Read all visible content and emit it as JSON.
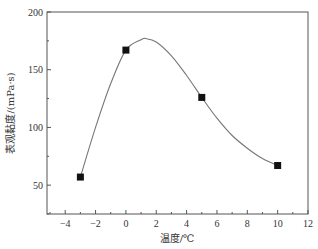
{
  "chart_data": {
    "type": "line",
    "title": "",
    "xlabel": "温度/℃",
    "ylabel": "表观黏度/(mPa·s)",
    "xlim": [
      -5.2,
      12
    ],
    "ylim": [
      25,
      200
    ],
    "xticks": [
      -4,
      -2,
      0,
      2,
      4,
      6,
      8,
      10,
      12
    ],
    "xtick_labels": [
      "−4",
      "−2",
      "0",
      "2",
      "4",
      "6",
      "8",
      "10",
      "12"
    ],
    "xminor_step": 1,
    "yticks": [
      50,
      100,
      150,
      200
    ],
    "ytick_labels": [
      "50",
      "100",
      "150",
      "200"
    ],
    "yminor_step": 25,
    "grid": false,
    "legend": null,
    "series": [
      {
        "name": "measured",
        "marker": "square",
        "x": [
          -3,
          0,
          5,
          10
        ],
        "y": [
          57,
          167,
          126,
          67
        ]
      },
      {
        "name": "fitted curve",
        "marker": "none",
        "smooth": true,
        "x": [
          -3,
          -2,
          -1,
          0,
          1,
          1.3,
          2,
          3,
          4,
          5,
          6,
          7,
          8,
          9,
          10
        ],
        "y": [
          57,
          100,
          138,
          167,
          176,
          177,
          174,
          162,
          145,
          126,
          108,
          93,
          82,
          73,
          67
        ]
      }
    ],
    "colors": {
      "line": "#777777",
      "marker": "#111111",
      "axis": "#555555"
    }
  }
}
